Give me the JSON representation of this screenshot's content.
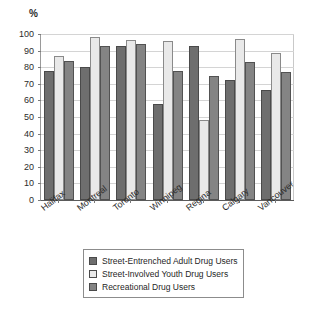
{
  "chart_data": {
    "type": "bar",
    "title": "",
    "subtitle": "",
    "xlabel": "",
    "ylabel": "%",
    "ylim": [
      0,
      100
    ],
    "ytick_step": 10,
    "yticks": [
      "100",
      "90",
      "80",
      "70",
      "60",
      "50",
      "40",
      "30",
      "20",
      "10",
      "0"
    ],
    "grid": true,
    "legend_position": "bottom",
    "categories": [
      "Halifax",
      "Montreal",
      "Toronto",
      "Winnipeg",
      "Regina",
      "Calgary",
      "Vancouver"
    ],
    "series": [
      {
        "name": "Street-Entrenched Adult Drug Users",
        "color": "#6e6e6e",
        "values": [
          77.5,
          80,
          93,
          58,
          93,
          72.5,
          66.5
        ]
      },
      {
        "name": "Street-Involved Youth Drug Users",
        "color": "#e9e9e9",
        "values": [
          86.5,
          98,
          96.5,
          95.5,
          48,
          97,
          88.5
        ]
      },
      {
        "name": "Recreational Drug Users",
        "color": "#848484",
        "values": [
          84,
          92.5,
          94,
          77.5,
          75,
          83,
          77
        ]
      }
    ]
  }
}
